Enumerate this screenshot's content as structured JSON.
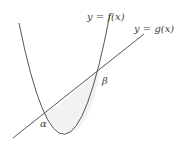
{
  "diagram": {
    "title": "",
    "curves": [
      {
        "name": "parabola",
        "label": "y = f(x)"
      },
      {
        "name": "line",
        "label": "y = g(x)"
      }
    ],
    "intersections": [
      {
        "name": "alpha",
        "label": "α"
      },
      {
        "name": "beta",
        "label": "β"
      }
    ],
    "shaded_region": "area between y = f(x) and y = g(x) from α to β",
    "colors": {
      "stroke": "#555555",
      "shade": "#f2f2f2",
      "background": "#ffffff"
    }
  }
}
